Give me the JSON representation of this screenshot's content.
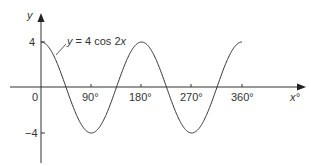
{
  "chart_data": {
    "type": "line",
    "title": "",
    "equation_label": "y = 4 cos 2x",
    "xlabel": "x°",
    "ylabel": "y",
    "x_ticks": [
      {
        "value": 0,
        "label": "0"
      },
      {
        "value": 90,
        "label": "90°"
      },
      {
        "value": 180,
        "label": "180°"
      },
      {
        "value": 270,
        "label": "270°"
      },
      {
        "value": 360,
        "label": "360°"
      }
    ],
    "y_ticks": [
      {
        "value": 4,
        "label": "4"
      },
      {
        "value": -4,
        "label": "−4"
      }
    ],
    "xlim": [
      0,
      360
    ],
    "ylim": [
      -4,
      4
    ],
    "grid": false,
    "series": [
      {
        "name": "y = 4 cos 2x",
        "function": "4*cos(2x)",
        "x": [
          0,
          45,
          90,
          135,
          180,
          225,
          270,
          315,
          360
        ],
        "values": [
          4,
          0,
          -4,
          0,
          4,
          0,
          -4,
          0,
          4
        ]
      }
    ]
  },
  "labels": {
    "y_axis": "y",
    "x_axis": "x°",
    "equation": "y = 4 cos 2x",
    "origin": "0",
    "tick_90": "90°",
    "tick_180": "180°",
    "tick_270": "270°",
    "tick_360": "360°",
    "tick_y_pos4": "4",
    "tick_y_neg4": "−4"
  }
}
